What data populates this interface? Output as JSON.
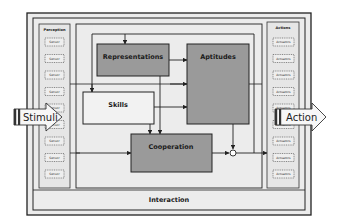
{
  "diagram": {
    "colors": {
      "frame_fill": "#ececec",
      "panel_fill": "#e6e6e6",
      "box_dark": "#9a9a9a",
      "box_light": "#f2f2f2",
      "stroke": "#222222"
    },
    "outer_label": "Interaction",
    "perception": {
      "title": "Perception",
      "items": [
        "Sensor",
        "Sensor",
        "Sensor",
        "Sensor",
        "Sensor",
        "Sensor",
        "Sensor",
        "Sensor",
        "Sensor"
      ]
    },
    "actions": {
      "title": "Actions",
      "items": [
        "Actuators",
        "Actuators",
        "Actuators",
        "Actuators",
        "Actuators",
        "Actuators",
        "Actuators",
        "Actuators",
        "Actuators"
      ]
    },
    "boxes": {
      "representations": "Representations",
      "aptitudes": "Aptitudes",
      "skills": "Skills",
      "cooperation": "Cooperation"
    },
    "input_arrow": "Stimuli",
    "output_arrow": "Action"
  }
}
